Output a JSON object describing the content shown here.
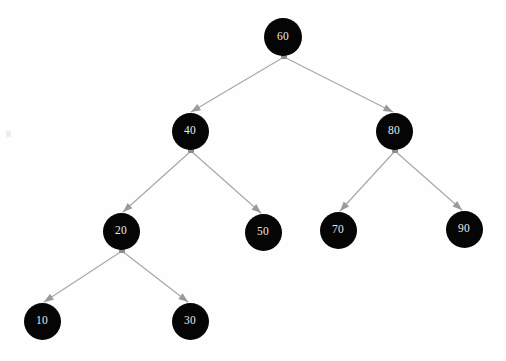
{
  "figure": {
    "kind": "binary-search-tree-diagram",
    "background_color": "#fefefe",
    "width": 506,
    "height": 361
  },
  "style": {
    "node_fill": "#050505",
    "node_text_color": "#e8e8e8",
    "edge_color": "#a8a8a8",
    "connector_color": "#8c8c8c",
    "arrow_color": "#9a9a9a",
    "edge_width": 1.2,
    "node_radius": 18.5
  },
  "nodes": [
    {
      "id": "n60",
      "label": "60",
      "cx": 283,
      "cy": 37,
      "r": 19.0,
      "level": 0,
      "has_children": true
    },
    {
      "id": "n40",
      "label": "40",
      "cx": 190,
      "cy": 131,
      "r": 18.5,
      "level": 1,
      "has_children": true
    },
    {
      "id": "n80",
      "label": "80",
      "cx": 394,
      "cy": 131,
      "r": 18.5,
      "level": 1,
      "has_children": true
    },
    {
      "id": "n20",
      "label": "20",
      "cx": 121,
      "cy": 231,
      "r": 18.5,
      "level": 2,
      "has_children": true
    },
    {
      "id": "n50",
      "label": "50",
      "cx": 263,
      "cy": 232,
      "r": 18.5,
      "level": 2,
      "has_children": false
    },
    {
      "id": "n70",
      "label": "70",
      "cx": 338,
      "cy": 230,
      "r": 18.5,
      "level": 2,
      "has_children": false
    },
    {
      "id": "n90",
      "label": "90",
      "cx": 464,
      "cy": 229,
      "r": 18.5,
      "level": 2,
      "has_children": false
    },
    {
      "id": "n10",
      "label": "10",
      "cx": 42,
      "cy": 321,
      "r": 18.5,
      "level": 3,
      "has_children": false
    },
    {
      "id": "n30",
      "label": "30",
      "cx": 190,
      "cy": 321,
      "r": 18.5,
      "level": 3,
      "has_children": false
    }
  ],
  "connectors": [
    {
      "id": "c60",
      "parent": "n60",
      "x": 284,
      "y": 56,
      "shape": "square",
      "size": 6
    },
    {
      "id": "c40",
      "parent": "n40",
      "x": 191,
      "y": 150,
      "shape": "square",
      "size": 6
    },
    {
      "id": "c80",
      "parent": "n80",
      "x": 395,
      "y": 150,
      "shape": "square",
      "size": 6
    },
    {
      "id": "c20",
      "parent": "n20",
      "x": 122,
      "y": 250,
      "shape": "square",
      "size": 6
    }
  ],
  "edges": [
    {
      "id": "e60-40",
      "from": "n60",
      "to": "n40",
      "x1": 284,
      "y1": 57,
      "x2": 191,
      "y2": 112,
      "side": "left"
    },
    {
      "id": "e60-80",
      "from": "n60",
      "to": "n80",
      "x1": 284,
      "y1": 57,
      "x2": 393,
      "y2": 112,
      "side": "right"
    },
    {
      "id": "e40-20",
      "from": "n40",
      "to": "n20",
      "x1": 191,
      "y1": 151,
      "x2": 123,
      "y2": 212,
      "side": "left"
    },
    {
      "id": "e40-50",
      "from": "n40",
      "to": "n50",
      "x1": 191,
      "y1": 151,
      "x2": 261,
      "y2": 213,
      "side": "right"
    },
    {
      "id": "e80-70",
      "from": "n80",
      "to": "n70",
      "x1": 395,
      "y1": 151,
      "x2": 340,
      "y2": 211,
      "side": "left"
    },
    {
      "id": "e80-90",
      "from": "n80",
      "to": "n90",
      "x1": 395,
      "y1": 151,
      "x2": 462,
      "y2": 210,
      "side": "right"
    },
    {
      "id": "e20-10",
      "from": "n20",
      "to": "n10",
      "x1": 122,
      "y1": 251,
      "x2": 44,
      "y2": 302,
      "side": "left"
    },
    {
      "id": "e20-30",
      "from": "n20",
      "to": "n30",
      "x1": 122,
      "y1": 251,
      "x2": 188,
      "y2": 302,
      "side": "right"
    }
  ],
  "artifacts": [
    {
      "id": "speck-left",
      "x": 6,
      "y": 131,
      "note": "faint scan speck"
    }
  ],
  "tree_structure": {
    "type": "binary-search-tree",
    "root": "60",
    "node_values": [
      60,
      40,
      80,
      20,
      50,
      70,
      90,
      10,
      30
    ],
    "inorder_traversal": [
      10,
      20,
      30,
      40,
      50,
      60,
      70,
      80,
      90
    ],
    "height": 4,
    "relations": [
      {
        "parent": "60",
        "left": "40",
        "right": "80"
      },
      {
        "parent": "40",
        "left": "20",
        "right": "50"
      },
      {
        "parent": "80",
        "left": "70",
        "right": "90"
      },
      {
        "parent": "20",
        "left": "10",
        "right": "30"
      }
    ],
    "leaves": [
      "10",
      "30",
      "50",
      "70",
      "90"
    ]
  }
}
